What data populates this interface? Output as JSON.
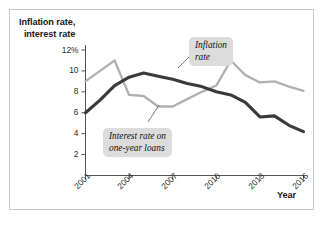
{
  "figure": {
    "y_axis_title": "Inflation rate,\ninterest rate",
    "y_axis_title_line1": "Inflation rate,",
    "y_axis_title_line2": "interest rate",
    "x_axis_title": "Year",
    "callouts": [
      {
        "id": "inflation",
        "line1": "Inflation",
        "line2": "rate"
      },
      {
        "id": "interest",
        "line1": "Interest rate on",
        "line2": "one-year loans"
      }
    ],
    "colors": {
      "inflation_line": "#b0b0b0",
      "interest_line": "#3a3a3a",
      "axis": "#555555",
      "frame": "#c9c9c9",
      "callout_bg": "#dcdcdc",
      "text": "#1a1a1a"
    }
  },
  "chart_data": {
    "type": "line",
    "title": "",
    "xlabel": "Year",
    "ylabel": "Inflation rate, interest rate",
    "grid": false,
    "legend": "annotated-callouts",
    "xlim": [
      2001,
      2016
    ],
    "ylim": [
      0,
      12
    ],
    "yticks": [
      2,
      4,
      6,
      8,
      10,
      12
    ],
    "ytick_labels": [
      "2",
      "4",
      "6",
      "8",
      "10",
      "12%"
    ],
    "xticks": [
      2001,
      2004,
      2007,
      2010,
      2013,
      2016
    ],
    "xtick_labels": [
      "2001",
      "2004",
      "2007",
      "2010",
      "2013",
      "2016"
    ],
    "x": [
      2001,
      2002,
      2003,
      2004,
      2005,
      2006,
      2007,
      2008,
      2009,
      2010,
      2011,
      2012,
      2013,
      2014,
      2015,
      2016
    ],
    "series": [
      {
        "name": "Inflation rate",
        "color": "#b0b0b0",
        "values": [
          9.0,
          10.0,
          11.0,
          7.7,
          7.6,
          6.6,
          6.6,
          7.3,
          8.0,
          8.6,
          11.0,
          9.6,
          8.9,
          9.0,
          8.5,
          8.1
        ]
      },
      {
        "name": "Interest rate on one-year loans",
        "color": "#3a3a3a",
        "values": [
          6.0,
          7.2,
          8.6,
          9.4,
          9.8,
          9.5,
          9.2,
          8.8,
          8.5,
          8.0,
          7.7,
          7.0,
          5.6,
          5.7,
          4.8,
          4.2
        ]
      }
    ]
  }
}
